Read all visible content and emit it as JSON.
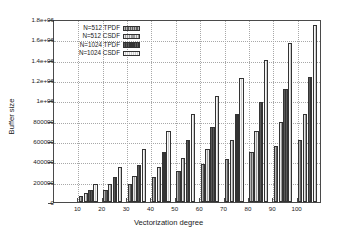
{
  "chart_data": {
    "type": "bar",
    "title": "",
    "xlabel": "Vectorization degree",
    "ylabel": "Buffer size",
    "categories": [
      "10",
      "20",
      "30",
      "40",
      "50",
      "60",
      "70",
      "80",
      "90",
      "100"
    ],
    "xlim": [
      0,
      110
    ],
    "ylim": [
      0,
      1800000
    ],
    "yticks": [
      0,
      200000,
      400000,
      600000,
      800000,
      1000000,
      1200000,
      1400000,
      1600000,
      1800000
    ],
    "ytick_labels": [
      "0",
      "200000",
      "400000",
      "600000",
      "800000",
      "1e+06",
      "1.2e+06",
      "1.4e+06",
      "1.6e+06",
      "1.8e+06"
    ],
    "xticks": [
      10,
      20,
      30,
      40,
      50,
      60,
      70,
      80,
      90,
      100
    ],
    "grid": true,
    "legend_position": "top-left-inside",
    "series": [
      {
        "name": "N=512 TPDF",
        "color": "#5e5e5e",
        "values": [
          62000,
          122000,
          182000,
          245000,
          305000,
          370000,
          428000,
          492000,
          552000,
          614000
        ]
      },
      {
        "name": "N=512 CSDF",
        "color": "#9e9e9e",
        "values": [
          88000,
          173000,
          258000,
          343000,
          432000,
          520000,
          610000,
          700000,
          788000,
          870000
        ]
      },
      {
        "name": "N=1024 TPDF",
        "color": "#343434",
        "values": [
          122000,
          245000,
          367000,
          492000,
          614000,
          740000,
          862000,
          985000,
          1108000,
          1228000
        ]
      },
      {
        "name": "N=1024 CSDF",
        "color": "#cdcdcd",
        "values": [
          175000,
          348000,
          520000,
          695000,
          870000,
          1045000,
          1215000,
          1395000,
          1565000,
          1740000
        ]
      }
    ]
  },
  "legend": {
    "items": [
      {
        "label": "N=512 TPDF"
      },
      {
        "label": "N=512 CSDF"
      },
      {
        "label": "N=1024 TPDF"
      },
      {
        "label": "N=1024 CSDF"
      }
    ]
  }
}
